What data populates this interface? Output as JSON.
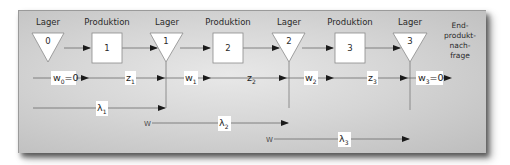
{
  "diagram": {
    "header_labels": {
      "lager_0": "Lager",
      "produktion_1": "Produktion",
      "lager_1": "Lager",
      "produktion_2": "Produktion",
      "lager_2": "Lager",
      "produktion_3": "Produktion",
      "lager_3": "Lager"
    },
    "nodes": {
      "lager": [
        "0",
        "1",
        "2",
        "3"
      ],
      "produktion": [
        "1",
        "2",
        "3"
      ]
    },
    "end_demand": [
      "End-",
      "produkt-",
      "nach-",
      "frage"
    ],
    "flow_labels": {
      "w0": {
        "base": "w",
        "sub": "0",
        "suffix": "=0"
      },
      "z1": {
        "base": "z",
        "sub": "1",
        "suffix": ""
      },
      "w1": {
        "base": "w",
        "sub": "1",
        "suffix": ""
      },
      "z2": {
        "base": "z",
        "sub": "2",
        "suffix": ""
      },
      "w2": {
        "base": "w",
        "sub": "2",
        "suffix": ""
      },
      "z3": {
        "base": "z",
        "sub": "3",
        "suffix": ""
      },
      "w3": {
        "base": "w",
        "sub": "3",
        "suffix": "=0"
      }
    },
    "lead_times": {
      "lambda1": {
        "base": "λ",
        "sub": "1"
      },
      "lambda2": {
        "base": "λ",
        "sub": "2"
      },
      "lambda3": {
        "base": "λ",
        "sub": "3"
      }
    },
    "w_markers": [
      "W",
      "W"
    ],
    "colors": {
      "line": "#555555",
      "node_fill": "#ffffff",
      "node_border": "#8a8a8a",
      "label_bg": "#ffffff"
    }
  }
}
